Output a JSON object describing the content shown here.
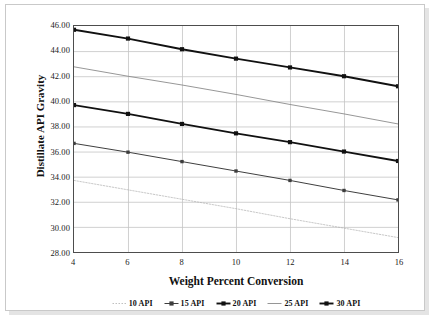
{
  "chart_data": {
    "type": "line",
    "title": "",
    "xlabel": "Weight Percent Conversion",
    "ylabel": "Distillate API Gravity",
    "x": [
      4,
      6,
      8,
      10,
      12,
      14,
      16
    ],
    "xlim": [
      4,
      16
    ],
    "ylim": [
      28.0,
      46.0
    ],
    "xticks": [
      "4",
      "6",
      "8",
      "10",
      "12",
      "14",
      "16"
    ],
    "yticks": [
      "28.00",
      "30.00",
      "32.00",
      "34.00",
      "36.00",
      "38.00",
      "40.00",
      "42.00",
      "44.00",
      "46.00"
    ],
    "ytick_values": [
      28.0,
      30.0,
      32.0,
      34.0,
      36.0,
      38.0,
      40.0,
      42.0,
      44.0,
      46.0
    ],
    "grid": "horizontal-and-vertical",
    "legend_position": "below-plot",
    "series": [
      {
        "name": "10 API",
        "values": [
          33.7,
          32.95,
          32.2,
          31.45,
          30.65,
          29.9,
          29.15
        ],
        "color": "#b0b0b0",
        "width": 0.7,
        "dash": "1.5,1.5",
        "marker": "none",
        "legend_marker": "dotted-dash"
      },
      {
        "name": "15 API",
        "values": [
          36.65,
          35.95,
          35.2,
          34.45,
          33.7,
          32.9,
          32.15
        ],
        "color": "#3d3d3d",
        "width": 1.0,
        "dash": "",
        "marker": "square",
        "legend_marker": "line-star"
      },
      {
        "name": "20 API",
        "values": [
          39.7,
          39.0,
          38.2,
          37.45,
          36.75,
          36.0,
          35.25
        ],
        "color": "#111111",
        "width": 1.9,
        "dash": "",
        "marker": "square",
        "legend_marker": "line-square"
      },
      {
        "name": "25 API",
        "values": [
          42.75,
          42.0,
          41.3,
          40.55,
          39.75,
          39.0,
          38.2
        ],
        "color": "#8a8a8a",
        "width": 0.9,
        "dash": "",
        "marker": "none",
        "legend_marker": "line-plus"
      },
      {
        "name": "30 API",
        "values": [
          45.7,
          45.0,
          44.15,
          43.4,
          42.7,
          42.0,
          41.2
        ],
        "color": "#111111",
        "width": 1.9,
        "dash": "",
        "marker": "square",
        "legend_marker": "line-star"
      }
    ],
    "gridline_color": "#c4c4c4",
    "axis_color": "#4d4d4d",
    "background": "#ffffff"
  }
}
